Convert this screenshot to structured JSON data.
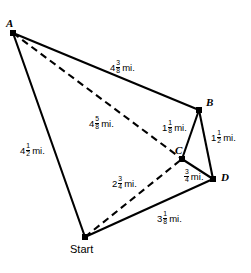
{
  "figure": {
    "background_color": "#ffffff",
    "line_color": "#000000",
    "vertices": [
      {
        "id": "A",
        "label": "A",
        "x": 13,
        "y": 33,
        "label_x": 6,
        "label_y": 18
      },
      {
        "id": "B",
        "label": "B",
        "x": 199,
        "y": 110,
        "label_x": 206,
        "label_y": 97
      },
      {
        "id": "C",
        "label": "C",
        "x": 182,
        "y": 159,
        "label_x": 175,
        "label_y": 145
      },
      {
        "id": "D",
        "label": "D",
        "x": 213,
        "y": 179,
        "label_x": 221,
        "label_y": 172
      },
      {
        "id": "Start",
        "label": "Start",
        "x": 85,
        "y": 237,
        "label_x": 70,
        "label_y": 244
      }
    ],
    "solid_edges": [
      {
        "from": "A",
        "to": "B"
      },
      {
        "from": "B",
        "to": "C"
      },
      {
        "from": "B",
        "to": "D"
      },
      {
        "from": "C",
        "to": "D"
      },
      {
        "from": "D",
        "to": "Start"
      },
      {
        "from": "Start",
        "to": "A"
      }
    ],
    "dashed_edges": [
      {
        "from": "A",
        "to": "C"
      },
      {
        "from": "Start",
        "to": "C"
      }
    ],
    "measurements": [
      {
        "id": "A-B",
        "whole": "4",
        "num": "3",
        "den": "8",
        "unit": "mi.",
        "x": 110,
        "y": 60
      },
      {
        "id": "A-C",
        "whole": "4",
        "num": "5",
        "den": "8",
        "unit": "mi.",
        "x": 89,
        "y": 116
      },
      {
        "id": "A-Start",
        "whole": "4",
        "num": "1",
        "den": "2",
        "unit": "mi.",
        "x": 20,
        "y": 143
      },
      {
        "id": "B-C",
        "whole": "1",
        "num": "1",
        "den": "8",
        "unit": "mi.",
        "x": 162,
        "y": 120
      },
      {
        "id": "B-D",
        "whole": "1",
        "num": "1",
        "den": "2",
        "unit": "mi.",
        "x": 211,
        "y": 130
      },
      {
        "id": "C-D",
        "whole": "",
        "num": "3",
        "den": "4",
        "unit": "mi.",
        "x": 184,
        "y": 169
      },
      {
        "id": "Start-C",
        "whole": "2",
        "num": "3",
        "den": "4",
        "unit": "mi.",
        "x": 112,
        "y": 176
      },
      {
        "id": "Start-D",
        "whole": "3",
        "num": "1",
        "den": "8",
        "unit": "mi.",
        "x": 157,
        "y": 211
      }
    ]
  }
}
